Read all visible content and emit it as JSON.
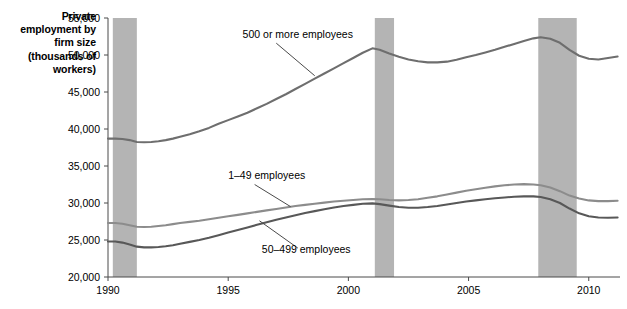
{
  "chart_data": {
    "type": "line",
    "title": "Private employment by firm size (thousands of workers)",
    "xlabel": "",
    "ylabel": "Private employment by firm size (thousands of workers)",
    "xlim": [
      1990,
      2011.3
    ],
    "ylim": [
      20000,
      55000
    ],
    "ytick_values": [
      20000,
      25000,
      30000,
      35000,
      40000,
      45000,
      50000,
      55000
    ],
    "ytick_labels": [
      "20,000",
      "25,000",
      "30,000",
      "35,000",
      "40,000",
      "45,000",
      "50,000",
      "55,000"
    ],
    "xtick_values": [
      1990,
      1995,
      2000,
      2005,
      2010
    ],
    "xtick_labels": [
      "1990",
      "1995",
      "2000",
      "2005",
      "2010"
    ],
    "grid": false,
    "legend": "inline-annotations",
    "annotations": [
      {
        "text": "500 or more employees",
        "x": 1995.6,
        "y": 52300
      },
      {
        "text": "1–49 employees",
        "x": 1995.0,
        "y": 33200
      },
      {
        "text": "50–499 employees",
        "x": 1996.4,
        "y": 23200
      }
    ],
    "shaded_bands": [
      {
        "label": "recession",
        "x0": 1990.2,
        "x1": 1991.2
      },
      {
        "label": "recession",
        "x0": 2001.1,
        "x1": 2001.9
      },
      {
        "label": "recession",
        "x0": 2007.9,
        "x1": 2009.5
      }
    ],
    "band_color": "#b4b4b4",
    "series": [
      {
        "name": "500 or more employees",
        "color": "#6e6e6e",
        "x": [
          1990.0,
          1990.3,
          1990.6,
          1990.9,
          1991.2,
          1991.5,
          1991.8,
          1992.1,
          1992.4,
          1992.7,
          1993.0,
          1993.4,
          1993.8,
          1994.2,
          1994.6,
          1995.0,
          1995.4,
          1995.8,
          1996.2,
          1996.6,
          1997.0,
          1997.4,
          1997.8,
          1998.2,
          1998.6,
          1999.0,
          1999.4,
          1999.8,
          2000.2,
          2000.6,
          2001.0,
          2001.3,
          2001.7,
          2002.1,
          2002.5,
          2002.9,
          2003.3,
          2003.7,
          2004.1,
          2004.5,
          2004.9,
          2005.3,
          2005.7,
          2006.1,
          2006.5,
          2006.9,
          2007.3,
          2007.7,
          2008.0,
          2008.4,
          2008.8,
          2009.2,
          2009.6,
          2010.0,
          2010.4,
          2010.8,
          2011.2
        ],
        "y": [
          38700,
          38700,
          38650,
          38500,
          38250,
          38200,
          38250,
          38350,
          38500,
          38700,
          38950,
          39300,
          39700,
          40150,
          40700,
          41200,
          41700,
          42200,
          42800,
          43400,
          44050,
          44700,
          45400,
          46100,
          46800,
          47500,
          48200,
          48900,
          49600,
          50300,
          50900,
          50700,
          50200,
          49750,
          49400,
          49150,
          49000,
          49000,
          49100,
          49350,
          49700,
          50000,
          50350,
          50700,
          51100,
          51500,
          51900,
          52250,
          52400,
          52200,
          51650,
          50700,
          49900,
          49500,
          49400,
          49600,
          49800
        ]
      },
      {
        "name": "1–49 employees",
        "color": "#8c8c8c",
        "x": [
          1990.0,
          1990.3,
          1990.6,
          1990.9,
          1991.2,
          1991.5,
          1991.8,
          1992.1,
          1992.4,
          1992.7,
          1993.0,
          1993.4,
          1993.8,
          1994.2,
          1994.6,
          1995.0,
          1995.4,
          1995.8,
          1996.2,
          1996.6,
          1997.0,
          1997.4,
          1997.8,
          1998.2,
          1998.6,
          1999.0,
          1999.4,
          1999.8,
          2000.2,
          2000.6,
          2001.0,
          2001.3,
          2001.7,
          2002.1,
          2002.5,
          2002.9,
          2003.3,
          2003.7,
          2004.1,
          2004.5,
          2004.9,
          2005.3,
          2005.7,
          2006.1,
          2006.5,
          2006.9,
          2007.3,
          2007.7,
          2008.0,
          2008.4,
          2008.8,
          2009.2,
          2009.6,
          2010.0,
          2010.4,
          2010.8,
          2011.2
        ],
        "y": [
          27300,
          27300,
          27200,
          27000,
          26800,
          26750,
          26800,
          26900,
          27000,
          27150,
          27300,
          27450,
          27600,
          27800,
          28000,
          28200,
          28400,
          28600,
          28800,
          29000,
          29200,
          29400,
          29600,
          29750,
          29900,
          30050,
          30200,
          30300,
          30400,
          30500,
          30550,
          30500,
          30400,
          30350,
          30400,
          30500,
          30700,
          30900,
          31150,
          31400,
          31650,
          31850,
          32050,
          32250,
          32400,
          32500,
          32550,
          32500,
          32400,
          32100,
          31600,
          31000,
          30600,
          30350,
          30250,
          30250,
          30300
        ]
      },
      {
        "name": "50–499 employees",
        "color": "#585858",
        "x": [
          1990.0,
          1990.3,
          1990.6,
          1990.9,
          1991.2,
          1991.5,
          1991.8,
          1992.1,
          1992.4,
          1992.7,
          1993.0,
          1993.4,
          1993.8,
          1994.2,
          1994.6,
          1995.0,
          1995.4,
          1995.8,
          1996.2,
          1996.6,
          1997.0,
          1997.4,
          1997.8,
          1998.2,
          1998.6,
          1999.0,
          1999.4,
          1999.8,
          2000.2,
          2000.6,
          2001.0,
          2001.3,
          2001.7,
          2002.1,
          2002.5,
          2002.9,
          2003.3,
          2003.7,
          2004.1,
          2004.5,
          2004.9,
          2005.3,
          2005.7,
          2006.1,
          2006.5,
          2006.9,
          2007.3,
          2007.7,
          2008.0,
          2008.4,
          2008.8,
          2009.2,
          2009.6,
          2010.0,
          2010.4,
          2010.8,
          2011.2
        ],
        "y": [
          24800,
          24800,
          24650,
          24400,
          24100,
          24000,
          24000,
          24050,
          24150,
          24300,
          24500,
          24750,
          25000,
          25300,
          25650,
          26000,
          26350,
          26700,
          27050,
          27400,
          27750,
          28050,
          28350,
          28650,
          28900,
          29150,
          29400,
          29600,
          29750,
          29900,
          29950,
          29850,
          29650,
          29450,
          29350,
          29350,
          29450,
          29600,
          29800,
          30000,
          30200,
          30350,
          30500,
          30650,
          30750,
          30850,
          30900,
          30900,
          30800,
          30500,
          30000,
          29250,
          28600,
          28200,
          28050,
          28000,
          28050
        ]
      }
    ]
  }
}
